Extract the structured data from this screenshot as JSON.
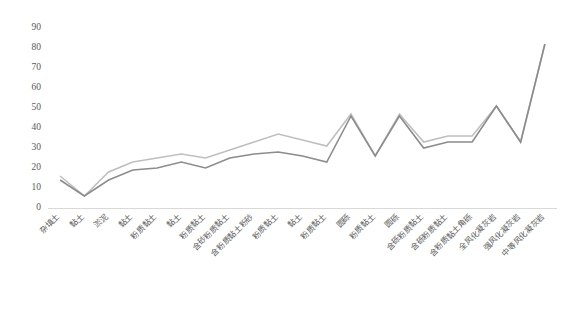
{
  "chart_data": {
    "type": "line",
    "title": "",
    "xlabel": "",
    "ylabel": "",
    "ylim": [
      0,
      90
    ],
    "yticks": [
      0,
      10,
      20,
      30,
      40,
      50,
      60,
      70,
      80,
      90
    ],
    "grid": false,
    "legend": "none",
    "categories": [
      "杂填土",
      "黏土",
      "淤泥",
      "黏土",
      "粉质黏土",
      "黏土",
      "粉质黏土",
      "含砂粉质黏土",
      "含粉质黏土粉砂",
      "粉质黏土",
      "黏土",
      "粉质黏土",
      "圆砾",
      "粉质黏土",
      "圆砾",
      "含砾粉质黏土",
      "含砾粉质黏土",
      "含粉质黏土角砾",
      "全风化凝灰岩",
      "强风化凝灰岩",
      "中等风化凝灰岩"
    ],
    "series": [
      {
        "name": "series-1",
        "color": "#bfbfbf",
        "values": [
          16,
          6,
          18,
          23,
          25,
          27,
          25,
          29,
          33,
          37,
          34,
          31,
          47,
          26,
          47,
          33,
          36,
          36,
          51,
          33,
          82
        ]
      },
      {
        "name": "series-2",
        "color": "#8c8c8c",
        "values": [
          14,
          6,
          14,
          19,
          20,
          23,
          20,
          25,
          27,
          28,
          26,
          23,
          46,
          26,
          46,
          30,
          33,
          33,
          51,
          33,
          82
        ]
      }
    ]
  },
  "axes": {
    "y_tick_labels": [
      "90",
      "80",
      "70",
      "60",
      "50",
      "40",
      "30",
      "20",
      "10",
      "0"
    ]
  },
  "colors": {
    "axis": "#d9d9d9",
    "tick_text": "#595959",
    "series_light": "#bfbfbf",
    "series_dark": "#8c8c8c",
    "background": "#ffffff"
  }
}
